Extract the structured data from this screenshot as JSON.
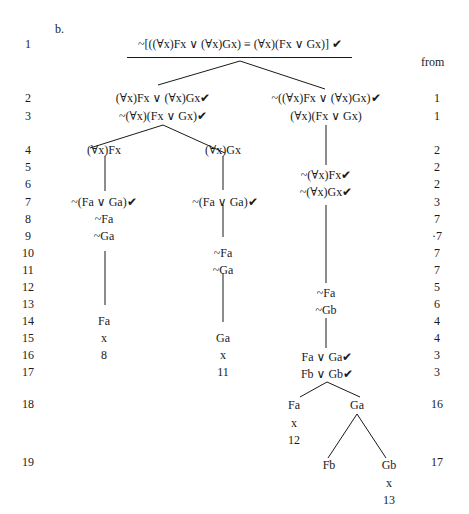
{
  "exercise_label": "b.",
  "from_header": "from",
  "root_formula": "~[((∀x)Fx ∨ (∀x)Gx) ≡ (∀x)(Fx ∨ Gx)] ✔",
  "line_numbers": [
    "1",
    "2",
    "3",
    "4",
    "5",
    "6",
    "7",
    "8",
    "9",
    "10",
    "11",
    "12",
    "13",
    "14",
    "15",
    "16",
    "17",
    "18",
    "19"
  ],
  "from_column": [
    {
      "line": "2",
      "from": "1"
    },
    {
      "line": "3",
      "from": "1"
    },
    {
      "line": "4",
      "from": "2"
    },
    {
      "line": "5",
      "from": "2"
    },
    {
      "line": "6",
      "from": "2"
    },
    {
      "line": "7",
      "from": "3"
    },
    {
      "line": "8",
      "from": "7"
    },
    {
      "line": "9",
      "from": "·7"
    },
    {
      "line": "10",
      "from": "7"
    },
    {
      "line": "11",
      "from": "7"
    },
    {
      "line": "12",
      "from": "5"
    },
    {
      "line": "13",
      "from": "6"
    },
    {
      "line": "14",
      "from": "4"
    },
    {
      "line": "15",
      "from": "4"
    },
    {
      "line": "16",
      "from": "3"
    },
    {
      "line": "17",
      "from": "3"
    },
    {
      "line": "18",
      "from": "16"
    },
    {
      "line": "19",
      "from": "17"
    }
  ],
  "tree": {
    "left_branch": {
      "line2": "(∀x)Fx ∨ (∀x)Gx✔",
      "line3": "~(∀x)(Fx ∨ Gx)✔",
      "left_sub": {
        "line4": "(∀x)Fx",
        "line7": "~(Fa ∨ Ga)✔",
        "line8": "~Fa",
        "line9": "~Ga",
        "line14": "Fa",
        "line15": "x",
        "line16": "8"
      },
      "right_sub": {
        "line4": "(∀x)Gx",
        "line7": "~(Fa ∨ Ga)✔",
        "line10": "~Fa",
        "line11": "~Ga",
        "line15": "Ga",
        "line16": "x",
        "line17": "11"
      }
    },
    "right_branch": {
      "line2": "~((∀x)Fx ∨ (∀x)Gx)✔",
      "line3": "(∀x)(Fx ∨ Gx)",
      "line5": "~(∀x)Fx✔",
      "line6": "~(∀x)Gx✔",
      "line12": "~Fa",
      "line13": "~Gb",
      "line16": "Fa ∨ Ga✔",
      "line17": "Fb ∨ Gb✔",
      "left_sub": {
        "line18": "Fa",
        "close": "x",
        "close_ref": "12"
      },
      "right_sub": {
        "line18": "Ga",
        "children": {
          "left": {
            "line19": "Fb"
          },
          "right": {
            "line19": "Gb",
            "close": "x",
            "close_ref": "13"
          }
        }
      }
    }
  }
}
